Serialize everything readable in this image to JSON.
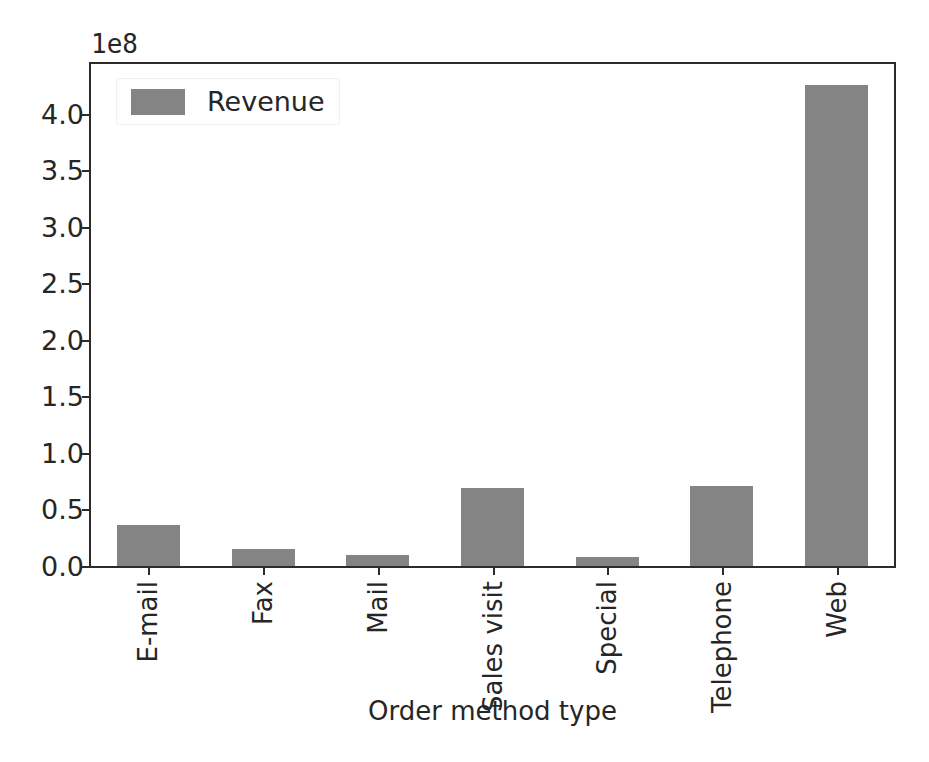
{
  "chart_data": {
    "type": "bar",
    "title": "",
    "subtitle": "",
    "xlabel": "Order method type",
    "ylabel": "",
    "categories": [
      "E-mail",
      "Fax",
      "Mail",
      "Sales visit",
      "Special",
      "Telephone",
      "Web"
    ],
    "values": [
      36000000,
      15000000,
      10000000,
      69000000,
      8000000,
      71000000,
      425000000
    ],
    "series": [
      {
        "name": "Revenue",
        "color": "#848484",
        "values": [
          36000000,
          15000000,
          10000000,
          69000000,
          8000000,
          71000000,
          425000000
        ]
      }
    ],
    "ylim": [
      0,
      444000000
    ],
    "ytick_values": [
      0,
      50000000,
      100000000,
      150000000,
      200000000,
      250000000,
      300000000,
      350000000,
      400000000
    ],
    "ytick_labels": [
      "0.0",
      "0.5",
      "1.0",
      "1.5",
      "2.0",
      "2.5",
      "3.0",
      "3.5",
      "4.0"
    ],
    "y_offset_text": "1e8",
    "y_offset_multiplier": 100000000,
    "grid": false,
    "legend_position": "upper left",
    "legend_entries": [
      {
        "label": "Revenue",
        "color": "#848484"
      }
    ],
    "xtick_rotation": 90,
    "bar_width_fraction": 0.55
  },
  "figure": {
    "background_color": "#ffffff",
    "axis_color": "#2b2b2b",
    "text_color": "#262626"
  }
}
